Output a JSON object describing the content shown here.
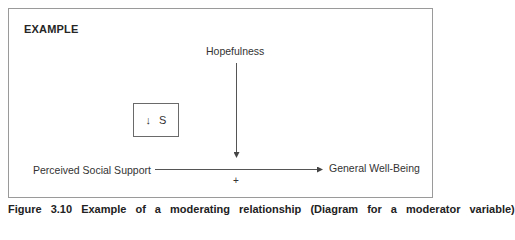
{
  "figure": {
    "heading": "EXAMPLE",
    "nodes": {
      "moderator": "Hopefulness",
      "predictor": "Perceived Social Support",
      "outcome": "General Well-Being"
    },
    "path_sign": "+",
    "legend_box": {
      "arrow_glyph": "↓",
      "label": "S"
    },
    "caption_partial": "Figure 3.10   Example of a moderating relationship (Diagram for a moderator variable)"
  },
  "colors": {
    "border": "#9a9a9a",
    "text": "#333333",
    "arrow": "#555555"
  }
}
